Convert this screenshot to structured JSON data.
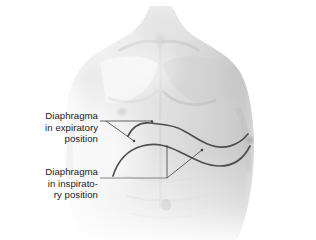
{
  "figure": {
    "background_color": "#ffffff",
    "skin_tone_light": "#f2f2f2",
    "skin_tone_mid": "#d8d8d8",
    "skin_tone_shadow": "#b9b9b9",
    "curve_color": "#4f4f4f",
    "leader_color": "#3f3f3f",
    "text_color": "#1d1d1d"
  },
  "labels": {
    "expiratory": {
      "name": "diaphragm-expiratory-label",
      "line1": "Diaphragma",
      "line2": "in expiratory",
      "line3": "position"
    },
    "inspiratory": {
      "name": "diaphragm-inspiratory-label",
      "line1": "Diaphragma",
      "line2": "in inspirato-",
      "line3": "ry position"
    }
  },
  "annotations": {
    "curve_expiratory_name": "diaphragm-expiratory-curve",
    "curve_inspiratory_name": "diaphragm-inspiratory-curve",
    "leader_expiratory_name": "leader-line-expiratory",
    "leader_inspiratory_name": "leader-line-inspiratory"
  }
}
